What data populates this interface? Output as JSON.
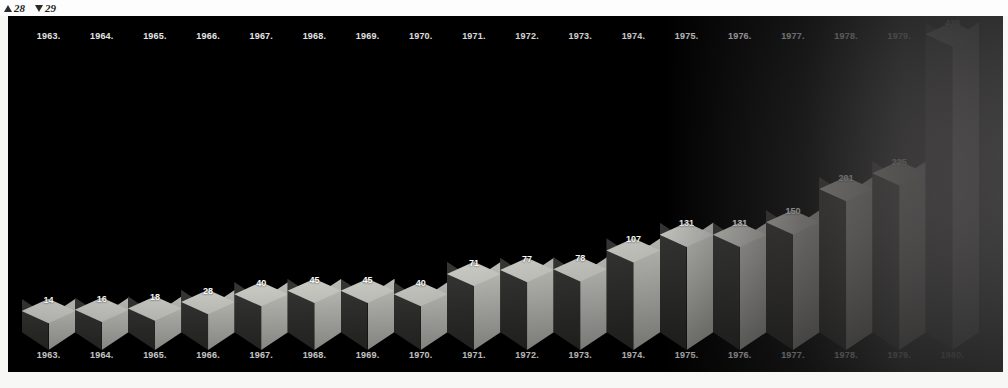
{
  "page_marks": [
    {
      "icon": "triangle-up-icon",
      "label": "28"
    },
    {
      "icon": "triangle-down-icon",
      "label": "29"
    }
  ],
  "chart_data": {
    "type": "bar",
    "title": "",
    "xlabel": "",
    "ylabel": "",
    "grid": false,
    "legend": "none",
    "ylim": [
      0,
      438
    ],
    "categories": [
      "1963.",
      "1964.",
      "1965.",
      "1966.",
      "1967.",
      "1968.",
      "1969.",
      "1970.",
      "1971.",
      "1972.",
      "1973.",
      "1974.",
      "1975.",
      "1976.",
      "1977.",
      "1978.",
      "1979.",
      "1980."
    ],
    "values": [
      14,
      16,
      18,
      28,
      40,
      45,
      45,
      40,
      71,
      77,
      78,
      107,
      131,
      131,
      150,
      201,
      225,
      438
    ],
    "top_axis_labels": [
      "1963.",
      "1964.",
      "1965.",
      "1966.",
      "1967.",
      "1968.",
      "1969.",
      "1970.",
      "1971.",
      "1972.",
      "1973.",
      "1974.",
      "1975.",
      "1976.",
      "1977.",
      "1978.",
      "1979."
    ],
    "bottom_axis_labels": [
      "1963.",
      "1964.",
      "1965.",
      "1966.",
      "1967.",
      "1968.",
      "1969.",
      "1970.",
      "1971.",
      "1972.",
      "1973.",
      "1974.",
      "1975.",
      "1976.",
      "1977.",
      "1978.",
      "1979.",
      "1980."
    ]
  },
  "colors": {
    "panel_background": "#000000",
    "bar_top_face": "#c9c9c4",
    "bar_right_face": "#b5b5b0",
    "bar_left_face": "#313130",
    "label_text": "#ffffff",
    "page_background": "#fdfdfd"
  }
}
